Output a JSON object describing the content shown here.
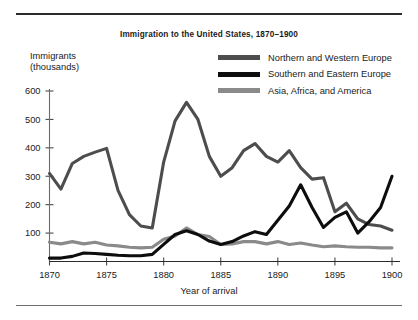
{
  "chart_data": {
    "type": "line",
    "title": "Immigration to the United States, 1870–1900",
    "xlabel": "Year of arrival",
    "ylabel": "Immigrants\n(thousands)",
    "ylabel_line1": "Immigrants",
    "ylabel_line2": "(thousands)",
    "xlim": [
      1870,
      1900
    ],
    "ylim": [
      0,
      640
    ],
    "grid": false,
    "legend_position": "top-right",
    "xticks": [
      1870,
      1875,
      1880,
      1885,
      1890,
      1895,
      1900
    ],
    "xtick_labels": [
      "1870",
      "1875",
      "1880",
      "1885",
      "1890",
      "1895",
      "1900"
    ],
    "yticks": [
      100,
      200,
      300,
      400,
      500,
      600
    ],
    "ytick_labels": [
      "100",
      "200",
      "300",
      "400",
      "500",
      "600"
    ],
    "x": [
      1870,
      1871,
      1872,
      1873,
      1874,
      1875,
      1876,
      1877,
      1878,
      1879,
      1880,
      1881,
      1882,
      1883,
      1884,
      1885,
      1886,
      1887,
      1888,
      1889,
      1890,
      1891,
      1892,
      1893,
      1894,
      1895,
      1896,
      1897,
      1898,
      1899,
      1900
    ],
    "series": [
      {
        "name": "Northern and Western Europe",
        "color": "#4d4d4d",
        "values": [
          310,
          255,
          345,
          370,
          385,
          398,
          250,
          165,
          125,
          118,
          350,
          495,
          560,
          500,
          370,
          300,
          330,
          390,
          415,
          370,
          350,
          390,
          330,
          290,
          295,
          175,
          205,
          150,
          130,
          125,
          110
        ]
      },
      {
        "name": "Southern and Eastern Europe",
        "color": "#0d0d0d",
        "values": [
          12,
          12,
          18,
          30,
          28,
          25,
          22,
          20,
          20,
          25,
          60,
          95,
          108,
          95,
          72,
          60,
          70,
          90,
          105,
          95,
          145,
          195,
          270,
          190,
          120,
          155,
          175,
          100,
          140,
          190,
          300
        ]
      },
      {
        "name": "Asia, Africa, and America",
        "color": "#8a8a8a",
        "values": [
          68,
          62,
          70,
          62,
          68,
          58,
          55,
          50,
          48,
          50,
          78,
          90,
          118,
          95,
          88,
          60,
          62,
          70,
          70,
          62,
          70,
          60,
          65,
          58,
          52,
          55,
          52,
          50,
          50,
          48,
          48
        ]
      }
    ]
  },
  "legend": {
    "items": [
      {
        "label": "Northern and Western Europe",
        "color": "#4d4d4d"
      },
      {
        "label": "Southern and Eastern Europe",
        "color": "#0d0d0d"
      },
      {
        "label": "Asia, Africa, and America",
        "color": "#8a8a8a"
      }
    ]
  }
}
